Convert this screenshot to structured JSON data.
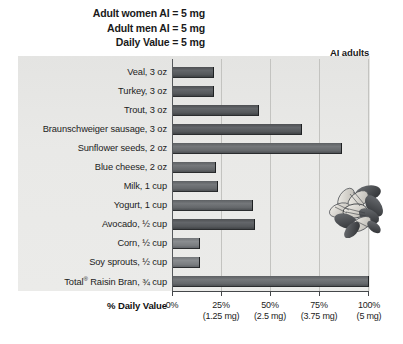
{
  "notes": [
    "Adult women AI = 5 mg",
    "Adult men AI = 5 mg",
    "Daily Value = 5 mg"
  ],
  "annotation": {
    "ai_adults_label": "AI adults"
  },
  "axis_title": "% Daily Value",
  "ticks": [
    {
      "pct": "0%",
      "mg": ""
    },
    {
      "pct": "25%",
      "mg": "(1.25 mg)"
    },
    {
      "pct": "50%",
      "mg": "(2.5 mg)"
    },
    {
      "pct": "75%",
      "mg": "(3.75 mg)"
    },
    {
      "pct": "100%",
      "mg": "(5 mg)"
    }
  ],
  "photo": {
    "name": "sunflower-seeds-photo"
  },
  "chart_data": {
    "type": "bar",
    "orientation": "horizontal",
    "title": "",
    "xlabel": "% Daily Value",
    "ylabel": "",
    "xlim": [
      0,
      100
    ],
    "grid": true,
    "legend": false,
    "annotations": [
      "Adult women AI = 5 mg",
      "Adult men AI = 5 mg",
      "Daily Value = 5 mg",
      "AI adults"
    ],
    "reference_line": {
      "label": "AI adults",
      "value": 100
    },
    "tick_labels": [
      "0%",
      "25% (1.25 mg)",
      "50% (2.5 mg)",
      "75% (3.75 mg)",
      "100% (5 mg)"
    ],
    "categories": [
      "Veal, 3 oz",
      "Turkey, 3 oz",
      "Trout, 3 oz",
      "Braunschweiger sausage, 3 oz",
      "Sunflower seeds, 2 oz",
      "Blue cheese, 2 oz",
      "Milk, 1 cup",
      "Yogurt, 1 cup",
      "Avocado, ½ cup",
      "Corn, ½ cup",
      "Soy sprouts, ½ cup",
      "Total® Raisin Bran, ¾ cup"
    ],
    "values": [
      21,
      21,
      44,
      66,
      86,
      22,
      23,
      41,
      42,
      14,
      14,
      100
    ],
    "values_mg": [
      1.05,
      1.05,
      2.2,
      3.3,
      4.3,
      1.1,
      1.15,
      2.05,
      2.1,
      0.7,
      0.7,
      5.0
    ]
  }
}
